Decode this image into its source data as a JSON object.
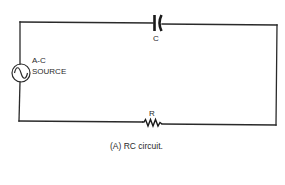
{
  "diagram": {
    "type": "circuit",
    "components": {
      "capacitor": {
        "label": "C"
      },
      "resistor": {
        "label": "R"
      },
      "source": {
        "label_line1": "A-C",
        "label_line2": "SOURCE",
        "symbol": "sine-wave"
      }
    },
    "caption": "(A)  RC circuit.",
    "colors": {
      "line": "#2a2a2a",
      "background": "#ffffff"
    }
  }
}
